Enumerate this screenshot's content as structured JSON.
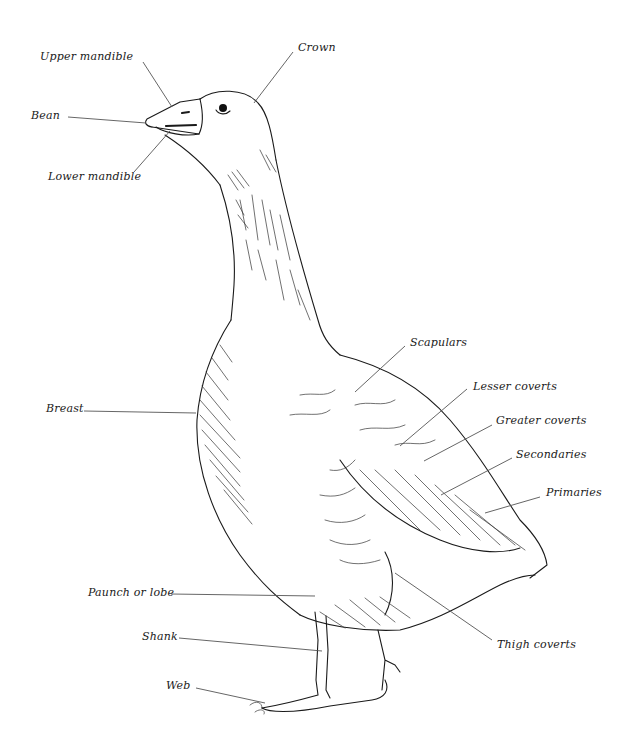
{
  "diagram": {
    "labels": [
      {
        "id": "upper-mandible",
        "text": "Upper mandible",
        "x": 40,
        "y": 51,
        "line": [
          143,
          62,
          172,
          107
        ]
      },
      {
        "id": "crown",
        "text": "Crown",
        "x": 298,
        "y": 42,
        "line": [
          293,
          52,
          254,
          103
        ]
      },
      {
        "id": "bean",
        "text": "Bean",
        "x": 31,
        "y": 110,
        "line": [
          68,
          117,
          146,
          123
        ]
      },
      {
        "id": "lower-mandible",
        "text": "Lower mandible",
        "x": 48,
        "y": 171,
        "line": [
          134,
          172,
          170,
          131
        ]
      },
      {
        "id": "scapulars",
        "text": "Scapulars",
        "x": 410,
        "y": 337,
        "line": [
          405,
          346,
          355,
          392
        ]
      },
      {
        "id": "lesser-coverts",
        "text": "Lesser coverts",
        "x": 473,
        "y": 381,
        "line": [
          467,
          389,
          400,
          446
        ]
      },
      {
        "id": "greater-coverts",
        "text": "Greater coverts",
        "x": 496,
        "y": 415,
        "line": [
          492,
          425,
          424,
          461
        ]
      },
      {
        "id": "secondaries",
        "text": "Secondaries",
        "x": 516,
        "y": 449,
        "line": [
          512,
          458,
          441,
          495
        ]
      },
      {
        "id": "primaries",
        "text": "Primaries",
        "x": 546,
        "y": 487,
        "line": [
          540,
          497,
          485,
          513
        ]
      },
      {
        "id": "breast",
        "text": "Breast",
        "x": 46,
        "y": 403,
        "line": [
          84,
          411,
          196,
          413
        ]
      },
      {
        "id": "paunch-or-lobe",
        "text": "Paunch or lobe",
        "x": 88,
        "y": 587,
        "line": [
          171,
          594,
          315,
          596
        ]
      },
      {
        "id": "shank",
        "text": "Shank",
        "x": 142,
        "y": 631,
        "line": [
          179,
          638,
          322,
          651
        ]
      },
      {
        "id": "web",
        "text": "Web",
        "x": 166,
        "y": 680,
        "line": [
          196,
          688,
          265,
          703
        ]
      },
      {
        "id": "thigh-coverts",
        "text": "Thigh coverts",
        "x": 497,
        "y": 639,
        "line": [
          492,
          640,
          395,
          573
        ]
      }
    ]
  }
}
